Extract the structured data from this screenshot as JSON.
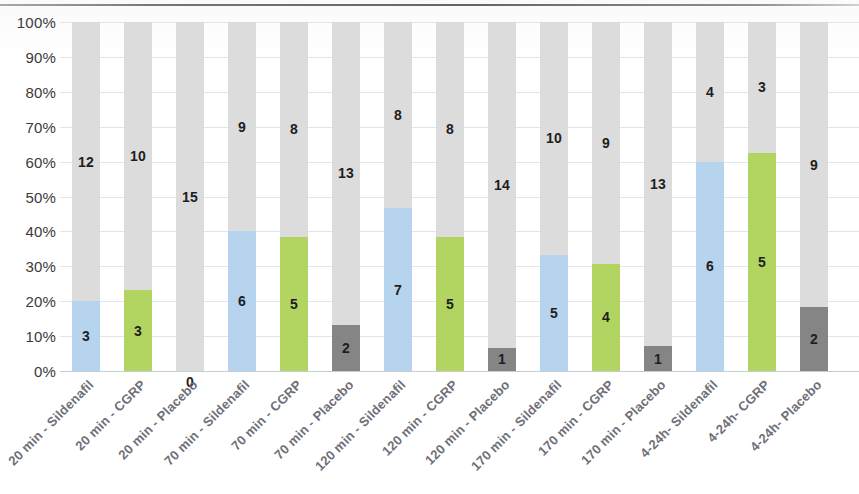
{
  "chart_data": {
    "type": "bar",
    "subtype": "stacked-100-percent",
    "title": "",
    "subtitle": "",
    "xlabel": "",
    "ylabel": "",
    "ylim": [
      0,
      100
    ],
    "grid": true,
    "legend_position": "none",
    "y_tick_labels": [
      "100%",
      "90%",
      "80%",
      "70%",
      "60%",
      "50%",
      "40%",
      "30%",
      "20%",
      "10%",
      "0%"
    ],
    "y_tick_values": [
      100,
      90,
      80,
      70,
      60,
      50,
      40,
      30,
      20,
      10,
      0
    ],
    "categories": [
      "20 min - Sildenafil",
      "20 min - CGRP",
      "20 min - Placebo",
      "70 min - Sildenafil",
      "70 min - CGRP",
      "70 min - Placebo",
      "120 min - Sildenafil",
      "120 min - CGRP",
      "120 min - Placebo",
      "170 min - Sildenafil",
      "170 min - CGRP",
      "170 min - Placebo",
      "4-24h- Sildenafil",
      "4-24h- CGRP",
      "4-24h- Placebo"
    ],
    "series": [
      {
        "name": "responders",
        "values": [
          3,
          3,
          0,
          6,
          5,
          2,
          7,
          5,
          1,
          5,
          4,
          1,
          6,
          5,
          2
        ]
      },
      {
        "name": "non-responders",
        "values": [
          12,
          10,
          15,
          9,
          8,
          13,
          8,
          8,
          14,
          10,
          9,
          13,
          4,
          3,
          9
        ]
      }
    ],
    "colors": {
      "sildenafil": "#b6d4ee",
      "cgrp": "#b2d561",
      "placebo": "#858585",
      "remainder": "#dcdcdc",
      "gridline": "#dfe6ef",
      "axis_text": "#3a3a3a",
      "category_text": "#6f6f78",
      "data_label": "#1e1e1e"
    },
    "bars": [
      {
        "category": "20 min - Sildenafil",
        "value": 3,
        "value_label": "3",
        "total": 15,
        "percent": 20.0,
        "color_key": "sildenafil",
        "remainder": 12,
        "remainder_label": "12"
      },
      {
        "category": "20 min - CGRP",
        "value": 3,
        "value_label": "3",
        "total": 13,
        "percent": 23.1,
        "color_key": "cgrp",
        "remainder": 10,
        "remainder_label": "10"
      },
      {
        "category": "20 min - Placebo",
        "value": 0,
        "value_label": "0",
        "total": 15,
        "percent": 0.0,
        "color_key": "placebo",
        "remainder": 15,
        "remainder_label": "15"
      },
      {
        "category": "70 min - Sildenafil",
        "value": 6,
        "value_label": "6",
        "total": 15,
        "percent": 40.0,
        "color_key": "sildenafil",
        "remainder": 9,
        "remainder_label": "9"
      },
      {
        "category": "70 min - CGRP",
        "value": 5,
        "value_label": "5",
        "total": 13,
        "percent": 38.5,
        "color_key": "cgrp",
        "remainder": 8,
        "remainder_label": "8"
      },
      {
        "category": "70 min - Placebo",
        "value": 2,
        "value_label": "2",
        "total": 15,
        "percent": 13.3,
        "color_key": "placebo",
        "remainder": 13,
        "remainder_label": "13"
      },
      {
        "category": "120 min - Sildenafil",
        "value": 7,
        "value_label": "7",
        "total": 15,
        "percent": 46.7,
        "color_key": "sildenafil",
        "remainder": 8,
        "remainder_label": "8"
      },
      {
        "category": "120 min - CGRP",
        "value": 5,
        "value_label": "5",
        "total": 13,
        "percent": 38.5,
        "color_key": "cgrp",
        "remainder": 8,
        "remainder_label": "8"
      },
      {
        "category": "120 min - Placebo",
        "value": 1,
        "value_label": "1",
        "total": 15,
        "percent": 6.7,
        "color_key": "placebo",
        "remainder": 14,
        "remainder_label": "14"
      },
      {
        "category": "170 min - Sildenafil",
        "value": 5,
        "value_label": "5",
        "total": 15,
        "percent": 33.3,
        "color_key": "sildenafil",
        "remainder": 10,
        "remainder_label": "10"
      },
      {
        "category": "170 min - CGRP",
        "value": 4,
        "value_label": "4",
        "total": 13,
        "percent": 30.8,
        "color_key": "cgrp",
        "remainder": 9,
        "remainder_label": "9"
      },
      {
        "category": "170 min - Placebo",
        "value": 1,
        "value_label": "1",
        "total": 14,
        "percent": 7.1,
        "color_key": "placebo",
        "remainder": 13,
        "remainder_label": "13"
      },
      {
        "category": "4-24h- Sildenafil",
        "value": 6,
        "value_label": "6",
        "total": 10,
        "percent": 60.0,
        "color_key": "sildenafil",
        "remainder": 4,
        "remainder_label": "4"
      },
      {
        "category": "4-24h- CGRP",
        "value": 5,
        "value_label": "5",
        "total": 8,
        "percent": 62.5,
        "color_key": "cgrp",
        "remainder": 3,
        "remainder_label": "3"
      },
      {
        "category": "4-24h- Placebo",
        "value": 2,
        "value_label": "2",
        "total": 11,
        "percent": 18.2,
        "color_key": "placebo",
        "remainder": 9,
        "remainder_label": "9"
      }
    ]
  }
}
